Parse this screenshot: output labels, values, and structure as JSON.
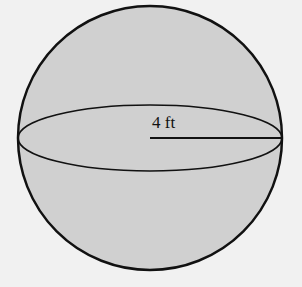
{
  "diagram": {
    "shape": "sphere",
    "radius_label": "4 ft",
    "colors": {
      "background": "#f1f1f1",
      "fill": "#d0d0d0",
      "stroke": "#111111"
    }
  }
}
